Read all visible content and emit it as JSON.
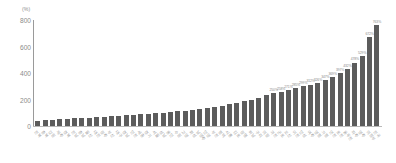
{
  "chart_data": {
    "type": "bar",
    "title": "",
    "subtitle": "",
    "xlabel": "",
    "ylabel": "",
    "unit_label": "(%)",
    "ylim": [
      0,
      800
    ],
    "yticks": [
      0,
      200,
      400,
      600,
      800
    ],
    "ytick_labels": [
      "0",
      "200",
      "400",
      "600",
      "800"
    ],
    "grid": false,
    "legend": null,
    "bar_color": "#5c5c5c",
    "axis_color": "#9a9a9a",
    "label_color": "#8b8b8b",
    "categories": [
      "전북",
      "충북",
      "강원",
      "제주",
      "경북",
      "전남",
      "충남",
      "울산",
      "대전",
      "광주",
      "부산",
      "대구",
      "경남",
      "인천",
      "세종",
      "경기",
      "서울",
      "성남",
      "용인",
      "수원",
      "고양",
      "화성",
      "남양주",
      "안양",
      "부천",
      "평택",
      "시흥",
      "김포",
      "광명",
      "하남",
      "구리",
      "의왕",
      "과천",
      "군포",
      "오산",
      "이천",
      "안성",
      "여주",
      "양평",
      "가평",
      "연천",
      "포천",
      "동두천",
      "파주",
      "양주",
      "의정부",
      "전국"
    ],
    "values": [
      41,
      44,
      47,
      50,
      54,
      57,
      60,
      63,
      66,
      70,
      73,
      77,
      80,
      84,
      88,
      92,
      96,
      101,
      106,
      111,
      117,
      123,
      130,
      137,
      145,
      154,
      163,
      174,
      186,
      199,
      214,
      231,
      250,
      258,
      271,
      285,
      299,
      312,
      326,
      347,
      369,
      397,
      432,
      478,
      529,
      672,
      763
    ],
    "value_labels": [
      "",
      "",
      "",
      "",
      "",
      "",
      "",
      "",
      "",
      "",
      "",
      "",
      "",
      "",
      "",
      "",
      "",
      "",
      "",
      "",
      "",
      "",
      "",
      "",
      "",
      "",
      "",
      "",
      "",
      "",
      "",
      "",
      "250%",
      "258%",
      "271%",
      "285%",
      "299%",
      "312%",
      "326%",
      "347%",
      "369%",
      "397%",
      "432%",
      "478%",
      "529%",
      "672%",
      "763%"
    ],
    "value_label_visible_from_index": 32
  }
}
